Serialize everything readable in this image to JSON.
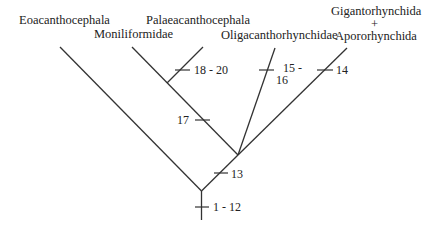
{
  "diagram": {
    "type": "cladogram",
    "taxa": [
      {
        "id": "eoacanthocephala",
        "label": "Eoacanthocephala"
      },
      {
        "id": "palaeacanthocephala",
        "label": "Palaeacanthocephala"
      },
      {
        "id": "moniliformidae",
        "label": "Moniliformidae"
      },
      {
        "id": "oligacanthorhynchidae",
        "label": "Oligacanthorhynchidae"
      },
      {
        "id": "gigantorhynchida",
        "label_line1": "Gigantorhynchida",
        "label_line2": "+",
        "label_line3": "Apororhynchida"
      }
    ],
    "characters": [
      {
        "id": "c18_20",
        "label": "18 - 20",
        "branch": "palaeacanthocephala"
      },
      {
        "id": "c15_16",
        "label_line1": "15 -",
        "label_line2": "16",
        "branch": "oligacanthorhynchidae"
      },
      {
        "id": "c14",
        "label": "14",
        "branch": "gigantorhynchida"
      },
      {
        "id": "c17",
        "label": "17",
        "branch": "moniliformidae+palaeacanthocephala"
      },
      {
        "id": "c13",
        "label": "13",
        "branch": "archiacanthocephala-clade"
      },
      {
        "id": "c1_12",
        "label": "1 - 12",
        "branch": "root"
      }
    ],
    "colors": {
      "line": "#333333",
      "text": "#222222",
      "background": "#ffffff"
    }
  }
}
